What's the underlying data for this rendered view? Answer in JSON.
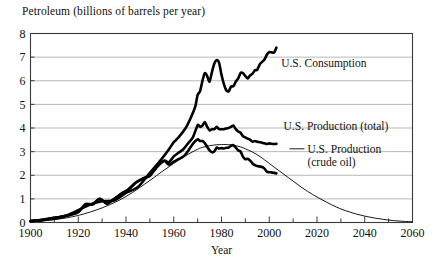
{
  "chart_data": {
    "type": "line",
    "title": "Petroleum (billions of barrels per year)",
    "xlabel": "Year",
    "ylabel": "",
    "xlim": [
      1900,
      2060
    ],
    "ylim": [
      0,
      8
    ],
    "grid": true,
    "grid_axis": "y",
    "legend_position": "inline-annotations",
    "xticks": [
      1900,
      1920,
      1940,
      1960,
      1980,
      2000,
      2020,
      2040,
      2060
    ],
    "xtick_labels": [
      "1900",
      "1920",
      "1940",
      "1960",
      "1980",
      "2000",
      "2020",
      "2040",
      "2060"
    ],
    "xminor_step": 10,
    "yticks": [
      0,
      1,
      2,
      3,
      4,
      5,
      6,
      7,
      8
    ],
    "ytick_labels": [
      "0",
      "1",
      "2",
      "3",
      "4",
      "5",
      "6",
      "7",
      "8"
    ],
    "series": [
      {
        "name": "U.S. Consumption",
        "style": "thick",
        "x": [
          1900,
          1905,
          1910,
          1915,
          1920,
          1925,
          1930,
          1935,
          1940,
          1945,
          1950,
          1955,
          1958,
          1960,
          1962,
          1965,
          1967,
          1969,
          1970,
          1971,
          1972,
          1973,
          1974,
          1975,
          1976,
          1977,
          1978,
          1979,
          1980,
          1981,
          1982,
          1983,
          1984,
          1985,
          1986,
          1987,
          1988,
          1989,
          1990,
          1991,
          1992,
          1993,
          1994,
          1995,
          1996,
          1997,
          1998,
          1999,
          2000,
          2001,
          2002,
          2003
        ],
        "y": [
          0.06,
          0.1,
          0.17,
          0.3,
          0.52,
          0.76,
          0.9,
          0.93,
          1.25,
          1.5,
          2.1,
          2.7,
          3.1,
          3.4,
          3.6,
          4.0,
          4.4,
          4.9,
          5.4,
          5.55,
          5.99,
          6.32,
          6.2,
          5.96,
          6.37,
          6.73,
          6.88,
          6.76,
          6.25,
          5.86,
          5.6,
          5.55,
          5.75,
          5.77,
          5.97,
          6.1,
          6.33,
          6.32,
          6.2,
          6.1,
          6.23,
          6.3,
          6.44,
          6.47,
          6.69,
          6.8,
          6.9,
          7.1,
          7.21,
          7.2,
          7.19,
          7.4
        ]
      },
      {
        "name": "U.S. Production (total)",
        "style": "thick",
        "x": [
          1900,
          1905,
          1910,
          1915,
          1920,
          1923,
          1926,
          1929,
          1932,
          1935,
          1938,
          1941,
          1944,
          1947,
          1950,
          1953,
          1956,
          1958,
          1960,
          1962,
          1964,
          1966,
          1968,
          1970,
          1971,
          1972,
          1973,
          1974,
          1975,
          1976,
          1977,
          1978,
          1979,
          1980,
          1981,
          1982,
          1983,
          1984,
          1985,
          1986,
          1987,
          1988,
          1989,
          1990,
          1991,
          1992,
          1993,
          1994,
          1995,
          1996,
          1997,
          1998,
          1999,
          2000,
          2001,
          2002,
          2003
        ],
        "y": [
          0.06,
          0.11,
          0.2,
          0.28,
          0.45,
          0.78,
          0.78,
          1.0,
          0.82,
          0.99,
          1.21,
          1.4,
          1.68,
          1.86,
          2.0,
          2.36,
          2.62,
          2.55,
          2.8,
          2.95,
          3.1,
          3.35,
          3.6,
          4.12,
          4.05,
          4.1,
          4.25,
          4.05,
          3.9,
          3.95,
          3.95,
          4.05,
          3.95,
          3.95,
          3.95,
          3.98,
          4.0,
          4.05,
          4.1,
          3.95,
          3.85,
          3.8,
          3.65,
          3.6,
          3.55,
          3.5,
          3.42,
          3.45,
          3.42,
          3.4,
          3.38,
          3.35,
          3.32,
          3.35,
          3.33,
          3.32,
          3.33
        ]
      },
      {
        "name": "U.S. Production (crude oil)",
        "style": "thick",
        "x": [
          1900,
          1905,
          1910,
          1915,
          1920,
          1923,
          1926,
          1929,
          1932,
          1935,
          1938,
          1941,
          1944,
          1947,
          1950,
          1953,
          1956,
          1958,
          1960,
          1962,
          1964,
          1966,
          1968,
          1970,
          1971,
          1972,
          1973,
          1974,
          1975,
          1976,
          1977,
          1978,
          1979,
          1980,
          1981,
          1982,
          1983,
          1984,
          1985,
          1986,
          1987,
          1988,
          1989,
          1990,
          1991,
          1992,
          1993,
          1994,
          1995,
          1996,
          1997,
          1998,
          1999,
          2000,
          2001,
          2002,
          2003
        ],
        "y": [
          0.06,
          0.11,
          0.2,
          0.28,
          0.44,
          0.75,
          0.76,
          1.0,
          0.79,
          0.99,
          1.21,
          1.4,
          1.68,
          1.86,
          1.97,
          2.36,
          2.6,
          2.45,
          2.58,
          2.68,
          2.79,
          3.03,
          3.33,
          3.52,
          3.45,
          3.45,
          3.36,
          3.2,
          3.05,
          2.97,
          3.01,
          3.17,
          3.13,
          3.15,
          3.13,
          3.16,
          3.17,
          3.25,
          3.27,
          3.17,
          3.05,
          3.0,
          2.78,
          2.68,
          2.7,
          2.62,
          2.5,
          2.43,
          2.39,
          2.37,
          2.35,
          2.28,
          2.15,
          2.13,
          2.12,
          2.1,
          2.08
        ]
      },
      {
        "name": "Hubbert projection (crude oil)",
        "style": "thin",
        "x": [
          1900,
          1910,
          1920,
          1930,
          1940,
          1950,
          1955,
          1960,
          1965,
          1970,
          1972,
          1975,
          1978,
          1980,
          1982,
          1985,
          1988,
          1990,
          1993,
          1996,
          2000,
          2004,
          2008,
          2012,
          2016,
          2020,
          2024,
          2028,
          2032,
          2036,
          2040,
          2044,
          2048,
          2052,
          2056,
          2060
        ],
        "y": [
          0.04,
          0.12,
          0.3,
          0.62,
          1.1,
          1.78,
          2.15,
          2.5,
          2.83,
          3.1,
          3.18,
          3.25,
          3.29,
          3.3,
          3.3,
          3.27,
          3.2,
          3.12,
          2.98,
          2.8,
          2.5,
          2.2,
          1.9,
          1.6,
          1.32,
          1.08,
          0.86,
          0.66,
          0.5,
          0.37,
          0.27,
          0.19,
          0.13,
          0.08,
          0.05,
          0.03
        ]
      }
    ],
    "annotations": [
      {
        "text": "U.S. Consumption",
        "series": "U.S. Consumption",
        "x": 2005,
        "y": 6.6,
        "has_leader": false
      },
      {
        "text": "U.S. Production (total)",
        "series": "U.S. Production (total)",
        "x": 2006,
        "y": 3.9,
        "has_leader": false
      },
      {
        "text_line1": "U.S. Production",
        "text_line2": "(crude oil)",
        "series": "U.S. Production (crude oil)",
        "x": 2016,
        "y": 2.95,
        "has_leader": true
      }
    ],
    "colors": {
      "line": "#000000",
      "grid": "#9a9a9a",
      "frame": "#3a3a3a",
      "background": "#ffffff",
      "text": "#111111"
    }
  }
}
